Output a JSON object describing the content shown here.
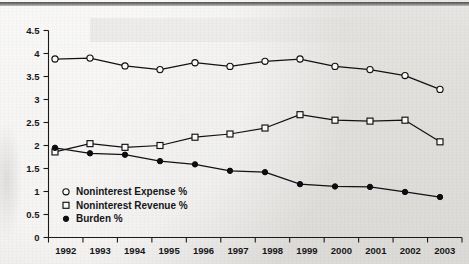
{
  "chart_data": {
    "type": "line",
    "title": "",
    "subtitle": "",
    "xlabel": "",
    "ylabel": "",
    "categories": [
      "1992",
      "1993",
      "1994",
      "1995",
      "1996",
      "1997",
      "1998",
      "1999",
      "2000",
      "2001",
      "2002",
      "2003"
    ],
    "ylim": [
      0,
      4.5
    ],
    "y_ticks": [
      "0",
      "0.5",
      "1",
      "1.5",
      "2",
      "2.5",
      "3",
      "3.5",
      "4",
      "4.5"
    ],
    "y_tick_values": [
      0,
      0.5,
      1,
      1.5,
      2,
      2.5,
      3,
      3.5,
      4,
      4.5
    ],
    "grid": false,
    "legend_position": "inside-lower-left",
    "series": [
      {
        "name": "Noninterest Expense %",
        "marker": "open-circle",
        "values": [
          3.88,
          3.9,
          3.73,
          3.65,
          3.8,
          3.72,
          3.83,
          3.88,
          3.72,
          3.65,
          3.52,
          3.22
        ]
      },
      {
        "name": "Noninterest Revenue %",
        "marker": "open-square",
        "values": [
          1.86,
          2.04,
          1.96,
          2.0,
          2.18,
          2.25,
          2.38,
          2.67,
          2.55,
          2.53,
          2.55,
          2.08
        ]
      },
      {
        "name": "Burden %",
        "marker": "filled-circle",
        "values": [
          1.95,
          1.83,
          1.8,
          1.66,
          1.59,
          1.45,
          1.42,
          1.16,
          1.11,
          1.1,
          0.99,
          0.88
        ]
      }
    ]
  },
  "legend": {
    "entries": [
      {
        "label": "Noninterest Expense %",
        "marker": "open-circle"
      },
      {
        "label": "Noninterest Revenue %",
        "marker": "open-square"
      },
      {
        "label": "Burden %",
        "marker": "filled-circle"
      }
    ]
  }
}
